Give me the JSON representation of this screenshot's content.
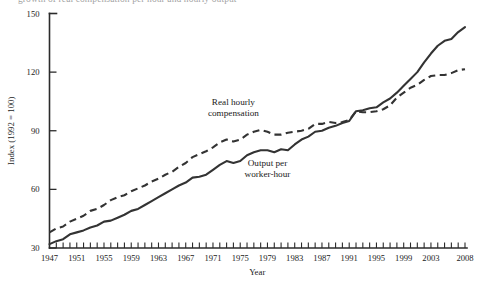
{
  "figure": {
    "caption_fragment": "growth of real compensation per hour and hourly output"
  },
  "chart_data": {
    "type": "line",
    "title": "",
    "subtitle": "",
    "xlabel": "Year",
    "ylabel": "Index (1992 = 100)",
    "xlim": [
      1947,
      2008
    ],
    "ylim": [
      30,
      150
    ],
    "grid": false,
    "legend_position": "inline-annotations",
    "y_ticks": [
      30,
      60,
      90,
      120,
      150
    ],
    "y_tick_labels": [
      "30",
      "60",
      "90",
      "120",
      "150"
    ],
    "x_ticks": [
      1947,
      1951,
      1955,
      1959,
      1963,
      1967,
      1971,
      1975,
      1979,
      1983,
      1987,
      1991,
      1995,
      1999,
      2003,
      2008
    ],
    "x_tick_labels": [
      "1947",
      "1951",
      "1955",
      "1959",
      "1963",
      "1967",
      "1971",
      "1975",
      "1979",
      "1983",
      "1987",
      "1991",
      "1995",
      "1999",
      "2003",
      "2008"
    ],
    "x_minor_tick_interval": 1,
    "x": [
      1947,
      1948,
      1949,
      1950,
      1951,
      1952,
      1953,
      1954,
      1955,
      1956,
      1957,
      1958,
      1959,
      1960,
      1961,
      1962,
      1963,
      1964,
      1965,
      1966,
      1967,
      1968,
      1969,
      1970,
      1971,
      1972,
      1973,
      1974,
      1975,
      1976,
      1977,
      1978,
      1979,
      1980,
      1981,
      1982,
      1983,
      1984,
      1985,
      1986,
      1987,
      1988,
      1989,
      1990,
      1991,
      1992,
      1993,
      1994,
      1995,
      1996,
      1997,
      1998,
      1999,
      2000,
      2001,
      2002,
      2003,
      2004,
      2005,
      2006,
      2007,
      2008
    ],
    "series": [
      {
        "name": "Real hourly compensation",
        "style": "dashed",
        "label_line_1": "Real hourly",
        "label_line_2": "compensation",
        "values": [
          38.0,
          40.0,
          41.0,
          43.5,
          45.0,
          46.5,
          49.0,
          50.0,
          52.0,
          54.5,
          56.0,
          57.0,
          59.0,
          60.5,
          62.0,
          64.0,
          65.5,
          67.5,
          69.0,
          71.5,
          73.5,
          76.5,
          78.0,
          79.5,
          81.5,
          84.0,
          85.5,
          84.5,
          85.5,
          88.0,
          89.5,
          90.5,
          89.5,
          88.0,
          88.0,
          89.0,
          89.5,
          90.0,
          91.0,
          93.5,
          93.5,
          94.5,
          94.0,
          94.5,
          95.5,
          100.0,
          99.5,
          99.5,
          100.0,
          101.0,
          103.0,
          107.0,
          109.5,
          112.0,
          113.5,
          116.0,
          118.0,
          118.5,
          118.5,
          119.5,
          121.0,
          121.5
        ]
      },
      {
        "name": "Output per worker-hour",
        "style": "solid",
        "label_line_1": "Output per",
        "label_line_2": "worker-hour",
        "values": [
          32.0,
          33.5,
          34.5,
          37.0,
          38.0,
          39.0,
          40.5,
          41.5,
          43.5,
          44.0,
          45.5,
          47.0,
          49.0,
          50.0,
          52.0,
          54.0,
          56.0,
          58.0,
          60.0,
          62.0,
          63.5,
          66.0,
          66.5,
          67.5,
          70.0,
          72.5,
          74.5,
          73.5,
          74.5,
          77.5,
          79.0,
          80.0,
          80.0,
          79.0,
          80.5,
          80.0,
          83.0,
          85.5,
          87.0,
          89.5,
          90.0,
          91.5,
          92.5,
          94.0,
          95.0,
          100.0,
          100.5,
          101.5,
          102.0,
          104.5,
          106.5,
          109.5,
          113.0,
          116.5,
          120.0,
          125.0,
          129.5,
          133.5,
          136.0,
          137.0,
          140.5,
          143.0
        ]
      }
    ],
    "annotations": [
      {
        "text": "Real hourly compensation",
        "x_year": 1974,
        "y_value": 103
      },
      {
        "text": "Output per worker-hour",
        "x_year": 1979,
        "y_value": 72
      }
    ]
  },
  "colors": {
    "line": "#333333",
    "axis": "#2b2b2b",
    "background": "#ffffff"
  }
}
